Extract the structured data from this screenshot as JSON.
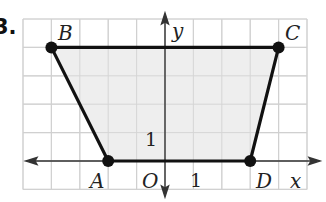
{
  "problem": {
    "number": "3."
  },
  "diagram": {
    "type": "coordinate-plane-trapezoid",
    "grid": {
      "x_min": -5,
      "x_max": 5,
      "y_min": -1,
      "y_max": 5,
      "cell_px": 28.4,
      "origin_px": [
        165,
        161
      ],
      "line_color": "#d4d4d4"
    },
    "axes": {
      "x_label": "x",
      "y_label": "y",
      "origin_label": "O",
      "x_unit_label": "1",
      "y_unit_label": "1",
      "color": "#333333"
    },
    "fill_color": "#eeeeee",
    "edge_color": "#111111",
    "points": [
      {
        "name": "B",
        "x": -4,
        "y": 4
      },
      {
        "name": "C",
        "x": 4,
        "y": 4
      },
      {
        "name": "D",
        "x": 3,
        "y": 0
      },
      {
        "name": "A",
        "x": -2,
        "y": 0
      }
    ]
  }
}
